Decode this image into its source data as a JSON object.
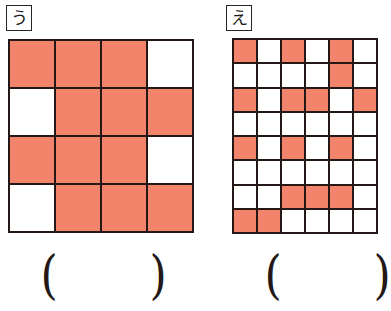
{
  "page": {
    "type": "math-worksheet-fraction-grids",
    "background_color": "#ffffff",
    "fill_color": "#F4836C",
    "line_color": "#231815"
  },
  "problems": [
    {
      "id": "u",
      "label": "う",
      "grid": {
        "columns": 4,
        "rows": 4,
        "total_cells": 16,
        "filled_count": 12,
        "cells": [
          [
            1,
            1,
            1,
            0
          ],
          [
            0,
            1,
            1,
            1
          ],
          [
            1,
            1,
            1,
            0
          ],
          [
            0,
            1,
            1,
            1
          ]
        ]
      },
      "answer": {
        "open_paren": "(",
        "close_paren": ")",
        "value": ""
      }
    },
    {
      "id": "e",
      "label": "え",
      "grid": {
        "columns": 6,
        "rows": 8,
        "total_cells": 48,
        "filled_count": 17,
        "cells": [
          [
            1,
            0,
            1,
            0,
            1,
            0
          ],
          [
            0,
            0,
            0,
            0,
            1,
            0
          ],
          [
            1,
            0,
            1,
            1,
            0,
            1
          ],
          [
            0,
            0,
            0,
            0,
            0,
            0
          ],
          [
            1,
            0,
            1,
            0,
            1,
            0
          ],
          [
            0,
            0,
            0,
            0,
            0,
            0
          ],
          [
            0,
            0,
            1,
            1,
            1,
            0
          ],
          [
            1,
            1,
            0,
            0,
            0,
            0
          ]
        ]
      },
      "answer": {
        "open_paren": "(",
        "close_paren": ")",
        "value": ""
      }
    }
  ]
}
